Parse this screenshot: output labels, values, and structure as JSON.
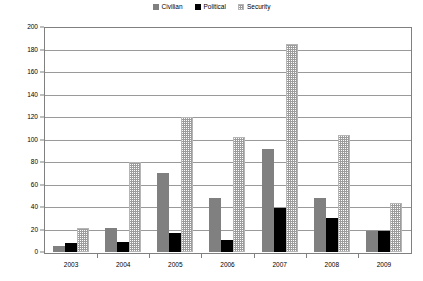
{
  "chart_data": {
    "type": "bar",
    "title": "",
    "subtitle": "",
    "xlabel": "",
    "ylabel": "",
    "categories": [
      "2003",
      "2004",
      "2005",
      "2006",
      "2007",
      "2008",
      "2009"
    ],
    "series": [
      {
        "name": "Civilian",
        "color": "#808080",
        "pattern": "solid-gray",
        "values": [
          5,
          21,
          70,
          48,
          92,
          48,
          19
        ]
      },
      {
        "name": "Political",
        "color": "#000000",
        "pattern": "solid-black",
        "values": [
          8,
          9,
          17,
          11,
          39,
          30,
          19
        ]
      },
      {
        "name": "Security",
        "color": "#9c9c9c",
        "pattern": "checker-hatch",
        "values": [
          21,
          80,
          120,
          102,
          185,
          104,
          44
        ]
      }
    ],
    "ylim": [
      0,
      200
    ],
    "ytick_step": 20,
    "yticks": [
      "200",
      "180",
      "160",
      "140",
      "120",
      "100",
      "80",
      "60",
      "40",
      "20",
      "0"
    ],
    "grid": true,
    "grid_axis": "y",
    "legend_position": "top-center",
    "legend": [
      "Civilian",
      "Political",
      "Security"
    ]
  },
  "axes": {
    "frame_color": "#808080",
    "gridline_color": "#9a9a9a"
  }
}
